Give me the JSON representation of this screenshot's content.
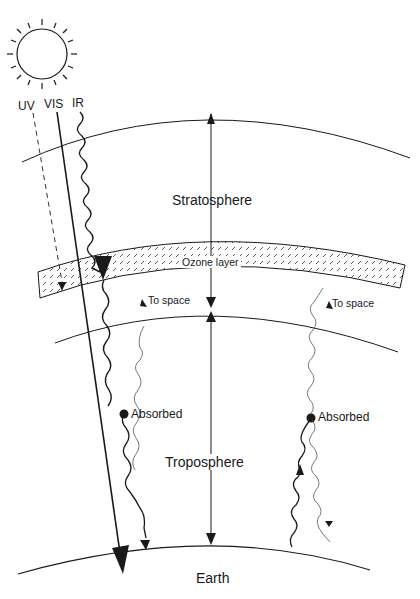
{
  "diagram": {
    "type": "atmospheric-radiation-diagram",
    "sun_label_uv": "UV",
    "sun_label_vis": "VIS",
    "sun_label_ir": "IR",
    "layers": {
      "stratosphere": "Stratosphere",
      "ozone": "Ozone layer",
      "troposphere": "Troposphere",
      "earth": "Earth"
    },
    "annotations": {
      "to_space_left": "To space",
      "to_space_right": "To space",
      "absorbed_left": "Absorbed",
      "absorbed_right": "Absorbed"
    },
    "colors": {
      "line": "#1a1a1a",
      "background": "#ffffff"
    }
  }
}
